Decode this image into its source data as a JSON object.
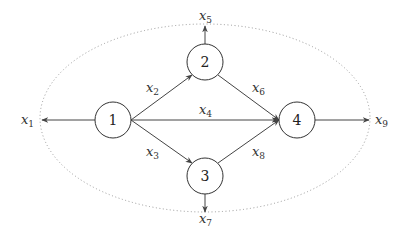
{
  "diagram": {
    "type": "flow-network",
    "boundary": {
      "shape": "dotted-ellipse",
      "cx": 205,
      "cy": 118,
      "rx": 165,
      "ry": 94,
      "color": "#999999"
    },
    "nodes": [
      {
        "id": "1",
        "label": "1",
        "cx": 113,
        "cy": 120,
        "r": 18
      },
      {
        "id": "2",
        "label": "2",
        "cx": 205,
        "cy": 62,
        "r": 18
      },
      {
        "id": "3",
        "label": "3",
        "cx": 205,
        "cy": 176,
        "r": 18
      },
      {
        "id": "4",
        "label": "4",
        "cx": 297,
        "cy": 120,
        "r": 18
      }
    ],
    "edges": [
      {
        "id": "x1",
        "var": "x",
        "sub": "1",
        "from": "1",
        "to": "outside-left"
      },
      {
        "id": "x2",
        "var": "x",
        "sub": "2",
        "from": "1",
        "to": "2"
      },
      {
        "id": "x3",
        "var": "x",
        "sub": "3",
        "from": "1",
        "to": "3"
      },
      {
        "id": "x4",
        "var": "x",
        "sub": "4",
        "from": "1",
        "to": "4"
      },
      {
        "id": "x5",
        "var": "x",
        "sub": "5",
        "from": "2",
        "to": "outside-top"
      },
      {
        "id": "x6",
        "var": "x",
        "sub": "6",
        "from": "2",
        "to": "4"
      },
      {
        "id": "x7",
        "var": "x",
        "sub": "7",
        "from": "3",
        "to": "outside-bottom"
      },
      {
        "id": "x8",
        "var": "x",
        "sub": "8",
        "from": "3",
        "to": "4"
      },
      {
        "id": "x9",
        "var": "x",
        "sub": "9",
        "from": "4",
        "to": "outside-right"
      }
    ]
  },
  "labels": {
    "n1": "1",
    "n2": "2",
    "n3": "3",
    "n4": "4",
    "x": "x",
    "s1": "1",
    "s2": "2",
    "s3": "3",
    "s4": "4",
    "s5": "5",
    "s6": "6",
    "s7": "7",
    "s8": "8",
    "s9": "9"
  }
}
